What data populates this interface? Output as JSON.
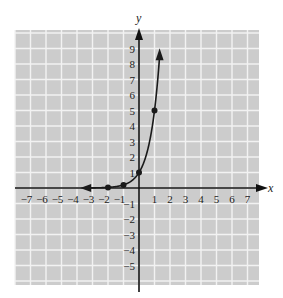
{
  "chart_data": {
    "type": "line",
    "title": "",
    "xlabel": "x",
    "ylabel": "y",
    "xlim": [
      -8,
      7.7
    ],
    "ylim": [
      -6.3,
      10
    ],
    "grid": true,
    "x_ticks": [
      "-7",
      "-6",
      "-5",
      "-4",
      "-3",
      "-2",
      "-1",
      "1",
      "2",
      "3",
      "4",
      "5",
      "6",
      "7"
    ],
    "y_ticks": [
      "9",
      "8",
      "7",
      "6",
      "5",
      "4",
      "3",
      "2",
      "1",
      "-1",
      "-2",
      "-3",
      "-4",
      "-5"
    ],
    "series": [
      {
        "name": "y = 5^x",
        "points": [
          {
            "x": -2,
            "y": 0.04
          },
          {
            "x": -1,
            "y": 0.2
          },
          {
            "x": 0,
            "y": 1
          },
          {
            "x": 1,
            "y": 5
          }
        ],
        "arrows": [
          "left",
          "up"
        ]
      }
    ]
  },
  "labels": {
    "x_axis": "x",
    "y_axis": "y"
  },
  "colors": {
    "grid_bg": "#cccccc",
    "grid_line": "#f2f2f2",
    "curve": "#1a1a1a"
  }
}
